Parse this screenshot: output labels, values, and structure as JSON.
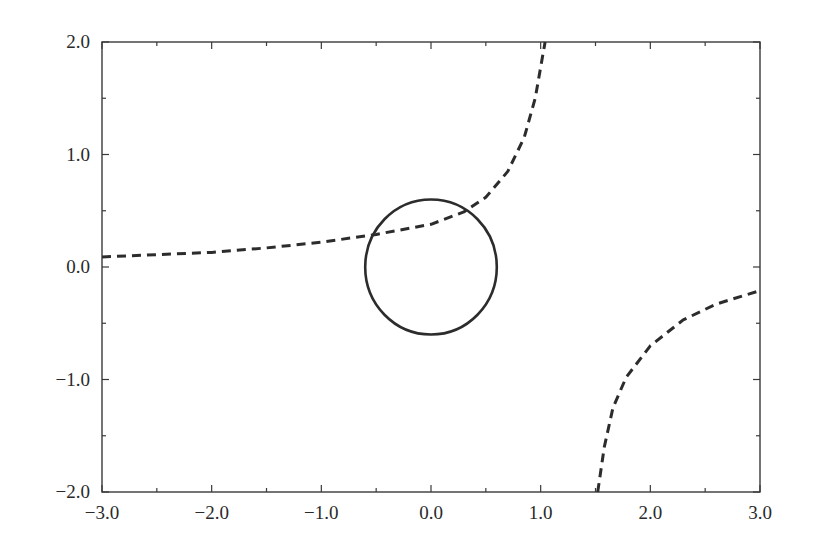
{
  "chart_data": {
    "type": "line",
    "title": "",
    "xlabel": "",
    "ylabel": "",
    "xlim": [
      -3.0,
      3.0
    ],
    "ylim": [
      -2.0,
      2.0
    ],
    "grid": false,
    "legend": null,
    "x_ticks": [
      "-3.0",
      "-2.0",
      "-1.0",
      "0.0",
      "1.0",
      "2.0",
      "3.0"
    ],
    "y_ticks": [
      "-2.0",
      "-1.0",
      "0.0",
      "1.0",
      "2.0"
    ],
    "series": [
      {
        "name": "dashed-curve-upper-branch",
        "style": "dashed",
        "color": "#2c2c2c",
        "points": [
          [
            -3.0,
            0.09
          ],
          [
            -2.5,
            0.11
          ],
          [
            -2.0,
            0.13
          ],
          [
            -1.5,
            0.17
          ],
          [
            -1.0,
            0.22
          ],
          [
            -0.5,
            0.29
          ],
          [
            0.0,
            0.38
          ],
          [
            0.3,
            0.49
          ],
          [
            0.5,
            0.62
          ],
          [
            0.7,
            0.85
          ],
          [
            0.85,
            1.15
          ],
          [
            0.95,
            1.5
          ],
          [
            1.04,
            2.0
          ]
        ]
      },
      {
        "name": "dashed-curve-lower-branch",
        "style": "dashed",
        "color": "#2c2c2c",
        "points": [
          [
            1.52,
            -2.0
          ],
          [
            1.58,
            -1.6
          ],
          [
            1.66,
            -1.25
          ],
          [
            1.78,
            -0.98
          ],
          [
            2.0,
            -0.7
          ],
          [
            2.3,
            -0.47
          ],
          [
            2.6,
            -0.33
          ],
          [
            3.0,
            -0.21
          ]
        ]
      },
      {
        "name": "circle",
        "style": "solid",
        "color": "#2c2c2c",
        "shape": "circle",
        "center": [
          0.0,
          0.0
        ],
        "radius": 0.6
      }
    ]
  }
}
